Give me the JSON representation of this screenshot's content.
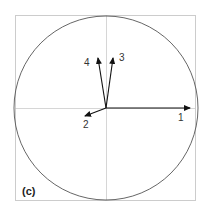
{
  "panel_label": "(c)",
  "colors": {
    "frame": "#cccccc",
    "axes": "#bbbbbb",
    "circle": "#555555",
    "arrow": "#111111",
    "text": "#333333"
  },
  "vectors": [
    {
      "id": "1",
      "label": "1",
      "tip": [
        190,
        108
      ],
      "label_pos": [
        178,
        121
      ]
    },
    {
      "id": "2",
      "label": "2",
      "tip": [
        84,
        116
      ],
      "label_pos": [
        83,
        128
      ]
    },
    {
      "id": "3",
      "label": "3",
      "tip": [
        113,
        57
      ],
      "label_pos": [
        119,
        60
      ]
    },
    {
      "id": "4",
      "label": "4",
      "tip": [
        98,
        57
      ],
      "label_pos": [
        84,
        65
      ]
    }
  ],
  "geometry": {
    "center": [
      106,
      108
    ],
    "radius": 92,
    "frame": [
      15,
      15,
      195,
      200
    ]
  }
}
